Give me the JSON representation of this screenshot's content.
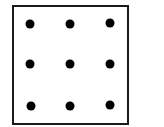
{
  "diagram": {
    "type": "nine-dot-grid",
    "rows": 3,
    "cols": 3,
    "colors": {
      "border": "#1a1a1a",
      "dot": "#000000",
      "background": "#ffffff"
    },
    "dots": [
      {
        "row": 0,
        "col": 0,
        "x": 30,
        "y": 24
      },
      {
        "row": 0,
        "col": 1,
        "x": 70,
        "y": 24
      },
      {
        "row": 0,
        "col": 2,
        "x": 110,
        "y": 23
      },
      {
        "row": 1,
        "col": 0,
        "x": 30,
        "y": 64
      },
      {
        "row": 1,
        "col": 1,
        "x": 70,
        "y": 64
      },
      {
        "row": 1,
        "col": 2,
        "x": 110,
        "y": 64
      },
      {
        "row": 2,
        "col": 0,
        "x": 31,
        "y": 106
      },
      {
        "row": 2,
        "col": 1,
        "x": 70,
        "y": 106
      },
      {
        "row": 2,
        "col": 2,
        "x": 110,
        "y": 105
      }
    ]
  }
}
